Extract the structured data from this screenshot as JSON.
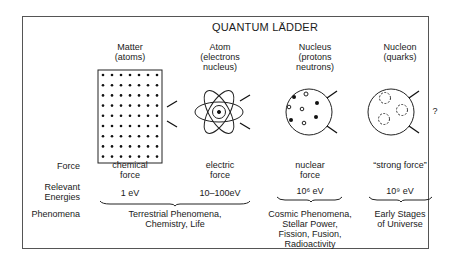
{
  "title": "QUANTUM LÄDDER",
  "columns": [
    {
      "name": "Matter",
      "sub": "(atoms)",
      "force_1": "chemical",
      "force_2": "force",
      "energy": "1 eV"
    },
    {
      "name": "Atom",
      "sub_1": "(electrons",
      "sub_2": "nucleus)",
      "force_1": "electric",
      "force_2": "force",
      "energy": "10–100eV"
    },
    {
      "name": "Nucleus",
      "sub_1": "(protons",
      "sub_2": "neutrons)",
      "force_1": "nuclear",
      "force_2": "force",
      "energy": "10⁶ eV"
    },
    {
      "name": "Nucleon",
      "sub": "(quarks)",
      "force_1": "“strong force”",
      "energy": "10⁹ eV",
      "question": "?"
    }
  ],
  "row_labels": {
    "force": "Force",
    "energies_1": "Relevant",
    "energies_2": "Energies",
    "phenomena": "Phenomena"
  },
  "phenomena": [
    {
      "lines": [
        "Terrestrial Phenomena,",
        "Chemistry, Life"
      ]
    },
    {
      "lines": [
        "Cosmic Phenomena,",
        "Stellar Power,",
        "Fission, Fusion,",
        "Radioactivity"
      ]
    },
    {
      "lines": [
        "Early Stages",
        "of Universe"
      ]
    }
  ],
  "icons": {
    "matter": "atom-lattice-icon",
    "atom": "atom-orbit-icon",
    "nucleus": "nucleus-icon",
    "nucleon": "nucleon-quarks-icon"
  }
}
